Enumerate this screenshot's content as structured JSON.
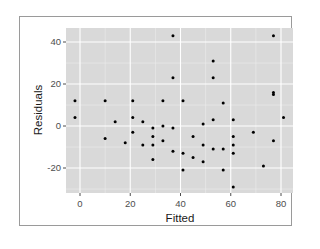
{
  "chart_data": {
    "type": "scatter",
    "title": "",
    "xlabel": "Fitted",
    "ylabel": "Residuals",
    "xlim": [
      -6,
      85
    ],
    "ylim": [
      -32,
      47
    ],
    "x_ticks": [
      0,
      20,
      40,
      60,
      80
    ],
    "y_ticks": [
      -20,
      0,
      20,
      40
    ],
    "x_tick_labels": [
      "0",
      "20",
      "40",
      "60",
      "80"
    ],
    "y_tick_labels": [
      "-20",
      "0",
      "20",
      "40"
    ],
    "grid": true,
    "legend": "none",
    "theme": "ggplot2 grey",
    "colors": {
      "panel": "#d9d9d9",
      "grid": "#ffffff",
      "point": "#000000"
    },
    "points": [
      {
        "x": -2,
        "y": 12
      },
      {
        "x": -2,
        "y": 4
      },
      {
        "x": 10,
        "y": 12
      },
      {
        "x": 10,
        "y": -6
      },
      {
        "x": 14,
        "y": 2
      },
      {
        "x": 18,
        "y": -8
      },
      {
        "x": 21,
        "y": 12
      },
      {
        "x": 21,
        "y": 4
      },
      {
        "x": 21,
        "y": -3
      },
      {
        "x": 25,
        "y": 2
      },
      {
        "x": 25,
        "y": -9
      },
      {
        "x": 29,
        "y": -1
      },
      {
        "x": 29,
        "y": -5
      },
      {
        "x": 29,
        "y": -9
      },
      {
        "x": 29,
        "y": -16
      },
      {
        "x": 33,
        "y": 12
      },
      {
        "x": 33,
        "y": 0
      },
      {
        "x": 33,
        "y": -7
      },
      {
        "x": 37,
        "y": 43
      },
      {
        "x": 37,
        "y": 23
      },
      {
        "x": 37,
        "y": -1
      },
      {
        "x": 37,
        "y": -12
      },
      {
        "x": 41,
        "y": 12
      },
      {
        "x": 41,
        "y": -13
      },
      {
        "x": 41,
        "y": -21
      },
      {
        "x": 45,
        "y": -5
      },
      {
        "x": 45,
        "y": -15
      },
      {
        "x": 49,
        "y": 1
      },
      {
        "x": 49,
        "y": -9
      },
      {
        "x": 49,
        "y": -17
      },
      {
        "x": 53,
        "y": 31
      },
      {
        "x": 53,
        "y": 23
      },
      {
        "x": 53,
        "y": 3
      },
      {
        "x": 53,
        "y": -11
      },
      {
        "x": 57,
        "y": 11
      },
      {
        "x": 57,
        "y": -11
      },
      {
        "x": 57,
        "y": -21
      },
      {
        "x": 61,
        "y": 3
      },
      {
        "x": 61,
        "y": -5
      },
      {
        "x": 61,
        "y": -9
      },
      {
        "x": 61,
        "y": -13
      },
      {
        "x": 61,
        "y": -29
      },
      {
        "x": 69,
        "y": -3
      },
      {
        "x": 73,
        "y": -19
      },
      {
        "x": 77,
        "y": 43
      },
      {
        "x": 77,
        "y": 16
      },
      {
        "x": 77,
        "y": 15
      },
      {
        "x": 77,
        "y": -7
      },
      {
        "x": 81,
        "y": 4
      }
    ]
  }
}
